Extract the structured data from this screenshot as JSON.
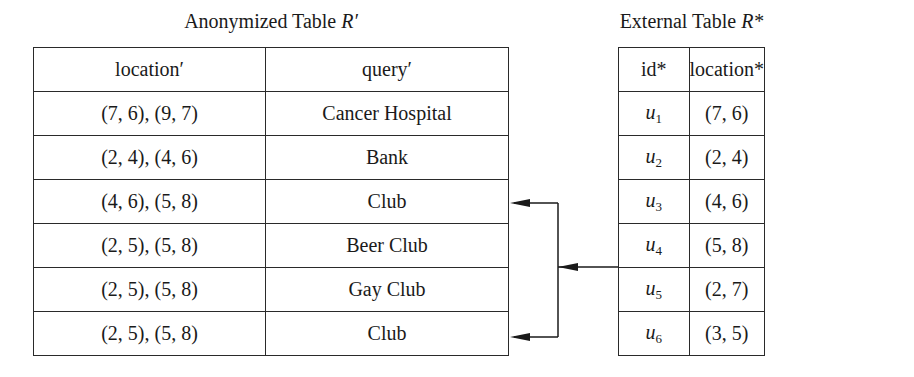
{
  "anonymized_table": {
    "caption": "Anonymized Table ",
    "caption_symbol": "R′",
    "headers": [
      "location′",
      "query′"
    ],
    "rows": [
      {
        "location": "(7, 6), (9, 7)",
        "query": "Cancer Hospital"
      },
      {
        "location": "(2, 4), (4, 6)",
        "query": "Bank"
      },
      {
        "location": "(4, 6), (5, 8)",
        "query": "Club"
      },
      {
        "location": "(2, 5), (5, 8)",
        "query": "Beer Club"
      },
      {
        "location": "(2, 5), (5, 8)",
        "query": "Gay Club"
      },
      {
        "location": "(2, 5), (5, 8)",
        "query": "Club"
      }
    ]
  },
  "external_table": {
    "caption": "External Table ",
    "caption_symbol": "R*",
    "headers": [
      "id*",
      "location*"
    ],
    "rows": [
      {
        "id": "u",
        "sub": "1",
        "location": "(7, 6)"
      },
      {
        "id": "u",
        "sub": "2",
        "location": "(2, 4)"
      },
      {
        "id": "u",
        "sub": "3",
        "location": "(4, 6)"
      },
      {
        "id": "u",
        "sub": "4",
        "location": "(5, 8)"
      },
      {
        "id": "u",
        "sub": "5",
        "location": "(2, 7)"
      },
      {
        "id": "u",
        "sub": "6",
        "location": "(3, 5)"
      }
    ]
  },
  "arrows": {
    "from": "u4 row (External Table)",
    "to": [
      "row 3 Club (4,6),(5,8)",
      "row 6 Club (2,5),(5,8)"
    ]
  }
}
